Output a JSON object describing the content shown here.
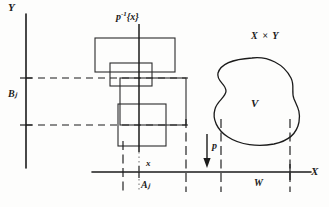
{
  "figure": {
    "type": "mathematical-diagram"
  },
  "labels": {
    "y_axis": "Y",
    "x_axis": "X",
    "b_set": "Bⱼ",
    "a_set": "Aⱼ",
    "point_x": "x",
    "w_set": "W",
    "projection": "p",
    "open_set_v": "V",
    "product_space": "X × Y",
    "fiber_prefix": "p",
    "fiber_exponent": "-1",
    "fiber_suffix": "{x}"
  },
  "colors": {
    "ink": "#1b1b1b",
    "background": "#fdfdfc",
    "rule": "#2a2a2a"
  },
  "geometry": {
    "y_axis": {
      "x": 26,
      "y_top": 14,
      "y_bottom": 168
    },
    "x_axis": {
      "y": 172,
      "x_left": 92,
      "x_right": 310
    },
    "fiber_line": {
      "x": 139,
      "y_top": 18,
      "y_bottom": 186
    },
    "rectangles": [
      {
        "name": "upper-large",
        "x": 95,
        "y": 38,
        "w": 80,
        "h": 34
      },
      {
        "name": "middle-small",
        "x": 110,
        "y": 63,
        "w": 42,
        "h": 23
      },
      {
        "name": "lower-square",
        "x": 118,
        "y": 104,
        "w": 48,
        "h": 42
      },
      {
        "name": "wide-band",
        "x": 120,
        "y": 78,
        "w": 66,
        "h": 50
      }
    ],
    "dashed_horizontals": [
      {
        "name": "upper-dash",
        "y": 78,
        "x_start": 26,
        "x_end": 186
      },
      {
        "name": "lower-dash",
        "y": 125,
        "x_start": 26,
        "x_end": 186
      }
    ],
    "dashdot_verticals": [
      {
        "name": "aj-left",
        "x": 123,
        "y_top": 140,
        "y_bottom": 190
      },
      {
        "name": "aj-right",
        "x": 186,
        "y_top": 120,
        "y_bottom": 190
      },
      {
        "name": "w-left",
        "x": 221,
        "y_top": 120,
        "y_bottom": 190
      },
      {
        "name": "w-right",
        "x": 290,
        "y_top": 120,
        "y_bottom": 190
      }
    ],
    "arrow_p": {
      "x": 208,
      "y_top": 136,
      "y_bottom": 166
    },
    "blob_v": {
      "cx": 256,
      "cy": 100,
      "rx": 46,
      "ry": 42
    }
  }
}
